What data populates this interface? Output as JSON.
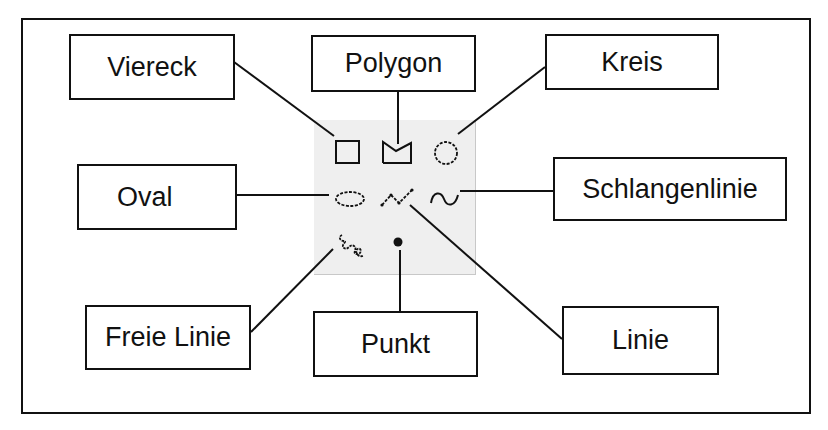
{
  "diagram": {
    "labels": {
      "viereck": "Viereck",
      "polygon": "Polygon",
      "kreis": "Kreis",
      "oval": "Oval",
      "schlangenlinie": "Schlangenlinie",
      "freie_linie": "Freie Linie",
      "punkt": "Punkt",
      "linie": "Linie"
    },
    "palette_icons": [
      {
        "name": "square-icon",
        "label": "Viereck"
      },
      {
        "name": "polygon-icon",
        "label": "Polygon"
      },
      {
        "name": "circle-icon",
        "label": "Kreis"
      },
      {
        "name": "oval-icon",
        "label": "Oval"
      },
      {
        "name": "polyline-icon",
        "label": "Linie"
      },
      {
        "name": "wave-icon",
        "label": "Schlangenlinie"
      },
      {
        "name": "freehand-icon",
        "label": "Freie Linie"
      },
      {
        "name": "point-icon",
        "label": "Punkt"
      }
    ],
    "colors": {
      "stroke": "#111111",
      "palette_bg": "#efefef",
      "background": "#ffffff"
    }
  }
}
